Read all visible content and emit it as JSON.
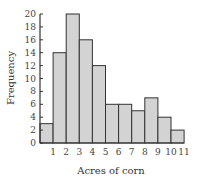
{
  "chart_data": {
    "type": "bar",
    "subtype": "histogram",
    "title": "",
    "xlabel": "Acres of corn",
    "ylabel": "Frequency",
    "categories": [
      "0-1",
      "1-2",
      "2-3",
      "3-4",
      "4-5",
      "5-6",
      "6-7",
      "7-8",
      "8-9",
      "9-10",
      "10-11"
    ],
    "x_ticks": [
      "1",
      "2",
      "3",
      "4",
      "5",
      "6",
      "7",
      "8",
      "9",
      "10",
      "11"
    ],
    "y_ticks": [
      "0",
      "2",
      "4",
      "6",
      "8",
      "10",
      "12",
      "14",
      "16",
      "18",
      "20"
    ],
    "values": [
      3,
      14,
      20,
      16,
      12,
      6,
      6,
      5,
      7,
      4,
      2
    ],
    "ylim": [
      0,
      20
    ],
    "xlim": [
      0,
      11
    ],
    "grid": false,
    "legend": null,
    "bar_fill": "#d3d3d3",
    "bar_stroke": "#333333"
  }
}
